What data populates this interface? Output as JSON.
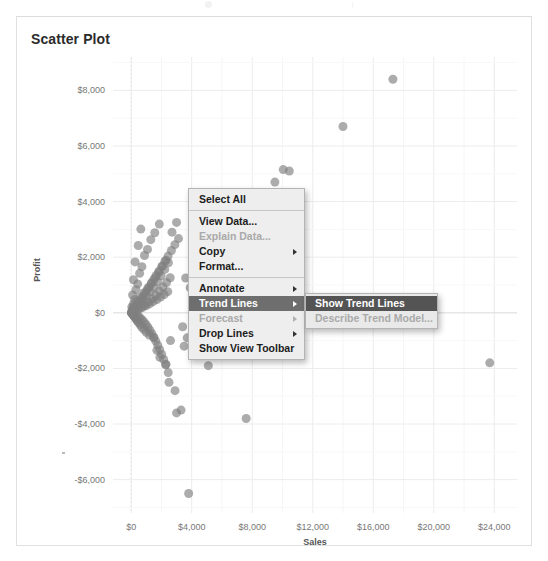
{
  "panel": {
    "title": "Scatter Plot"
  },
  "chart_data": {
    "type": "scatter",
    "title": "Scatter Plot",
    "xlabel": "Sales",
    "ylabel": "Profit",
    "xlim": [
      -1200,
      25500
    ],
    "ylim": [
      -7200,
      9200
    ],
    "grid": true,
    "legend": false,
    "xticks": [
      "$0",
      "$4,000",
      "$8,000",
      "$12,000",
      "$16,000",
      "$20,000",
      "$24,000"
    ],
    "xtick_values": [
      0,
      4000,
      8000,
      12000,
      16000,
      20000,
      24000
    ],
    "yticks": [
      "$8,000",
      "$6,000",
      "$4,000",
      "$2,000",
      "$0",
      "-$2,000",
      "-$4,000",
      "-$6,000"
    ],
    "ytick_values": [
      8000,
      6000,
      4000,
      2000,
      0,
      -2000,
      -4000,
      -6000
    ],
    "marker": {
      "color": "#7f7f7f",
      "opacity": 0.65,
      "size": 9
    },
    "points": [
      [
        17300,
        8400
      ],
      [
        14000,
        6700
      ],
      [
        10050,
        5150
      ],
      [
        10450,
        5100
      ],
      [
        9500,
        4700
      ],
      [
        11200,
        4000
      ],
      [
        23700,
        -1800
      ],
      [
        7600,
        -3800
      ],
      [
        3800,
        -6500
      ],
      [
        3000,
        -3600
      ],
      [
        3300,
        -3500
      ],
      [
        2900,
        -2800
      ],
      [
        2500,
        -2500
      ],
      [
        2450,
        -2150
      ],
      [
        2300,
        -1850
      ],
      [
        1900,
        -1600
      ],
      [
        1700,
        -1350
      ],
      [
        5100,
        -1900
      ],
      [
        4400,
        -1500
      ],
      [
        3500,
        -1200
      ],
      [
        2600,
        -1000
      ],
      [
        1500,
        -900
      ],
      [
        1200,
        -800
      ],
      [
        1000,
        -700
      ],
      [
        850,
        -600
      ],
      [
        700,
        -520
      ],
      [
        600,
        -430
      ],
      [
        500,
        -360
      ],
      [
        420,
        -300
      ],
      [
        360,
        -250
      ],
      [
        300,
        -200
      ],
      [
        250,
        -160
      ],
      [
        210,
        -130
      ],
      [
        180,
        -100
      ],
      [
        150,
        -80
      ],
      [
        120,
        -60
      ],
      [
        100,
        -45
      ],
      [
        85,
        -30
      ],
      [
        70,
        -20
      ],
      [
        60,
        -12
      ],
      [
        50,
        -8
      ],
      [
        40,
        -4
      ],
      [
        30,
        0
      ],
      [
        25,
        5
      ],
      [
        20,
        10
      ],
      [
        60,
        30
      ],
      [
        90,
        50
      ],
      [
        130,
        75
      ],
      [
        170,
        100
      ],
      [
        220,
        140
      ],
      [
        280,
        180
      ],
      [
        340,
        230
      ],
      [
        410,
        290
      ],
      [
        490,
        350
      ],
      [
        580,
        420
      ],
      [
        680,
        500
      ],
      [
        790,
        590
      ],
      [
        910,
        690
      ],
      [
        1040,
        800
      ],
      [
        1180,
        920
      ],
      [
        1330,
        1050
      ],
      [
        1490,
        1190
      ],
      [
        1660,
        1340
      ],
      [
        1840,
        1500
      ],
      [
        2030,
        1670
      ],
      [
        2230,
        1850
      ],
      [
        2440,
        2040
      ],
      [
        2660,
        2240
      ],
      [
        2890,
        2450
      ],
      [
        3130,
        2670
      ],
      [
        300,
        260
      ],
      [
        420,
        150
      ],
      [
        540,
        330
      ],
      [
        660,
        210
      ],
      [
        780,
        460
      ],
      [
        900,
        280
      ],
      [
        1020,
        610
      ],
      [
        1140,
        390
      ],
      [
        1260,
        760
      ],
      [
        1380,
        500
      ],
      [
        1500,
        930
      ],
      [
        1620,
        640
      ],
      [
        1740,
        1120
      ],
      [
        1860,
        780
      ],
      [
        1980,
        1330
      ],
      [
        2100,
        930
      ],
      [
        2220,
        1560
      ],
      [
        2340,
        1090
      ],
      [
        2460,
        1800
      ],
      [
        2580,
        1260
      ],
      [
        200,
        -30
      ],
      [
        330,
        -70
      ],
      [
        460,
        -120
      ],
      [
        590,
        -180
      ],
      [
        720,
        -250
      ],
      [
        850,
        -330
      ],
      [
        980,
        -420
      ],
      [
        1110,
        -520
      ],
      [
        1240,
        -630
      ],
      [
        1370,
        -750
      ],
      [
        1500,
        -880
      ],
      [
        1630,
        -1020
      ],
      [
        1760,
        -1170
      ],
      [
        1890,
        -1330
      ],
      [
        2020,
        -1500
      ],
      [
        2150,
        -1680
      ],
      [
        2280,
        -1870
      ],
      [
        140,
        190
      ],
      [
        260,
        70
      ],
      [
        380,
        410
      ],
      [
        500,
        120
      ],
      [
        620,
        560
      ],
      [
        740,
        190
      ],
      [
        860,
        720
      ],
      [
        980,
        250
      ],
      [
        1100,
        890
      ],
      [
        1220,
        320
      ],
      [
        1340,
        1070
      ],
      [
        1460,
        400
      ],
      [
        1580,
        1260
      ],
      [
        1700,
        480
      ],
      [
        1820,
        1460
      ],
      [
        1940,
        570
      ],
      [
        2060,
        1670
      ],
      [
        2180,
        660
      ],
      [
        2300,
        1890
      ],
      [
        2420,
        760
      ],
      [
        3600,
        1250
      ],
      [
        3900,
        900
      ],
      [
        4200,
        600
      ],
      [
        4600,
        350
      ],
      [
        3400,
        -500
      ],
      [
        3700,
        -900
      ],
      [
        4100,
        -400
      ],
      [
        4900,
        -1100
      ],
      [
        5400,
        -1400
      ],
      [
        2700,
        2900
      ],
      [
        3000,
        3250
      ],
      [
        80,
        120
      ],
      [
        45,
        210
      ],
      [
        160,
        330
      ],
      [
        240,
        480
      ],
      [
        95,
        640
      ],
      [
        320,
        830
      ],
      [
        430,
        1040
      ],
      [
        150,
        1190
      ],
      [
        560,
        1420
      ],
      [
        710,
        1660
      ],
      [
        260,
        1830
      ],
      [
        880,
        2060
      ],
      [
        1080,
        2280
      ],
      [
        470,
        2420
      ],
      [
        1300,
        2630
      ],
      [
        1560,
        2880
      ],
      [
        640,
        3010
      ],
      [
        1860,
        3190
      ]
    ]
  },
  "context_menu": {
    "items": [
      {
        "label": "Select All",
        "state": "normal",
        "submenu": false
      },
      {
        "type": "separator"
      },
      {
        "label": "View Data...",
        "state": "normal",
        "submenu": false
      },
      {
        "label": "Explain Data...",
        "state": "disabled",
        "submenu": false
      },
      {
        "label": "Copy",
        "state": "normal",
        "submenu": true
      },
      {
        "label": "Format...",
        "state": "normal",
        "submenu": false
      },
      {
        "type": "separator"
      },
      {
        "label": "Annotate",
        "state": "normal",
        "submenu": true
      },
      {
        "label": "Trend Lines",
        "state": "selected",
        "submenu": true
      },
      {
        "label": "Forecast",
        "state": "disabled",
        "submenu": true
      },
      {
        "label": "Drop Lines",
        "state": "normal",
        "submenu": true
      },
      {
        "label": "Show View Toolbar",
        "state": "normal",
        "submenu": false
      }
    ]
  },
  "submenu": {
    "items": [
      {
        "label": "Show Trend Lines",
        "state": "selected"
      },
      {
        "label": "Describe Trend Model...",
        "state": "disabled"
      }
    ]
  }
}
